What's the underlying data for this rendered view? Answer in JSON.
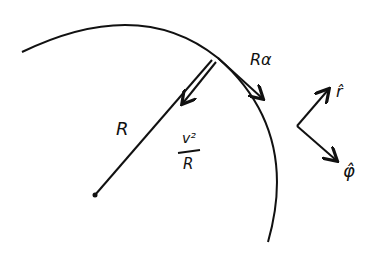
{
  "diagram": {
    "labels": {
      "radius": "R",
      "arc": "Rα",
      "accel_num": "v²",
      "accel_den": "R",
      "r_hat": "r̂",
      "phi_hat": "φ̂"
    },
    "colors": {
      "ink": "#111111",
      "background": "#ffffff"
    }
  }
}
